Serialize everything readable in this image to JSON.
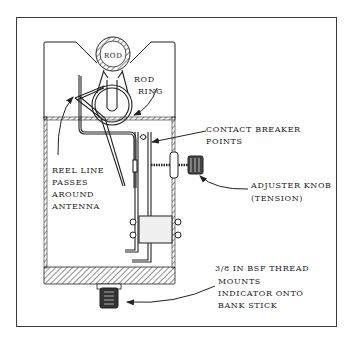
{
  "figure": {
    "type": "technical-illustration",
    "colors": {
      "line": "#222222",
      "frame": "#3a3a3a",
      "background": "#ffffff"
    }
  },
  "labels": {
    "rod": "ROD",
    "rod_ring_1": "ROD",
    "rod_ring_2": "RING",
    "reel_line_1": "REEL LINE",
    "reel_line_2": "PASSES",
    "reel_line_3": "AROUND",
    "reel_line_4": "ANTENNA",
    "contact_1": "CONTACT BREAKER",
    "contact_2": "POINTS",
    "adjuster_1": "ADJUSTER KNOB",
    "adjuster_2": "(TENSION)",
    "thread_1": "3/8 IN BSF THREAD",
    "thread_2": "MOUNTS",
    "thread_3": "INDICATOR ONTO",
    "thread_4": "BANK STICK"
  }
}
